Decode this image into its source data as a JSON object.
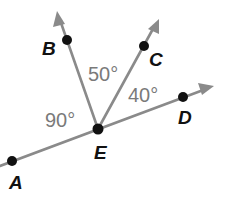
{
  "diagram": {
    "type": "geometry-angles",
    "vertex": "E",
    "points": [
      {
        "id": "A",
        "label": "A",
        "x": 12,
        "y": 161,
        "label_x": 9,
        "label_y": 189
      },
      {
        "id": "B",
        "label": "B",
        "x": 67,
        "y": 40,
        "label_x": 42,
        "label_y": 55
      },
      {
        "id": "C",
        "label": "C",
        "x": 144,
        "y": 46,
        "label_x": 149,
        "label_y": 66
      },
      {
        "id": "D",
        "label": "D",
        "x": 183,
        "y": 97,
        "label_x": 178,
        "label_y": 124
      },
      {
        "id": "E",
        "label": "E",
        "x": 98,
        "y": 129,
        "label_x": 94,
        "label_y": 159
      }
    ],
    "rays": [
      {
        "name": "ray-EB",
        "from": "E",
        "through": "B"
      },
      {
        "name": "ray-EC",
        "from": "E",
        "through": "C"
      },
      {
        "name": "line-AD",
        "from": "A",
        "through": "D"
      }
    ],
    "angles": [
      {
        "id": "angle-AEB",
        "label": "90°",
        "x": 45,
        "y": 127
      },
      {
        "id": "angle-BEC",
        "label": "50°",
        "x": 88,
        "y": 81
      },
      {
        "id": "angle-CED",
        "label": "40°",
        "x": 128,
        "y": 102
      }
    ],
    "colors": {
      "ray": "#8a8a8a",
      "point": "#111111",
      "point_label": "#111111",
      "angle_label": "#7a7a7a"
    }
  }
}
